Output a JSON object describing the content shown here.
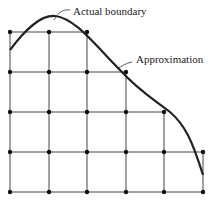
{
  "diagram": {
    "labels": {
      "actual": "Actual boundary",
      "approx": "Approximation"
    },
    "grid": {
      "xs": [
        10,
        49,
        87,
        126,
        164,
        203
      ],
      "rows": [
        {
          "y": 32,
          "count": 3
        },
        {
          "y": 72,
          "count": 4
        },
        {
          "y": 112,
          "count": 5
        },
        {
          "y": 152,
          "count": 6
        },
        {
          "y": 192,
          "count": 6
        }
      ]
    },
    "colors": {
      "line": "#333333",
      "curve": "#222222",
      "text": "#222222"
    }
  }
}
